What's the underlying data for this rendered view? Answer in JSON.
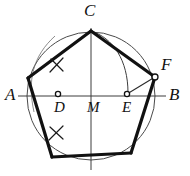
{
  "figure": {
    "kind": "geometric-construction",
    "width": 190,
    "height": 176,
    "background_color": "#ffffff",
    "ink_color": "#111111",
    "thin_stroke_color": "#555555",
    "thick_stroke_width": 3.2,
    "thin_stroke_width": 0.9,
    "circle": {
      "center_x": 91,
      "center_y": 96,
      "radius": 64
    },
    "points": {
      "A": {
        "x": 27,
        "y": 96,
        "marker": "none"
      },
      "B": {
        "x": 155,
        "y": 96,
        "marker": "none"
      },
      "C": {
        "x": 91,
        "y": 31,
        "marker": "none"
      },
      "D": {
        "x": 58,
        "y": 94,
        "marker": "open-circle"
      },
      "E": {
        "x": 127,
        "y": 94,
        "marker": "open-circle"
      },
      "F": {
        "x": 155,
        "y": 77,
        "marker": "open-circle"
      },
      "M": {
        "x": 91,
        "y": 96,
        "marker": "none"
      },
      "P_left": {
        "x": 28,
        "y": 78,
        "marker": "none"
      },
      "P_bottom_left": {
        "x": 52,
        "y": 157,
        "marker": "none"
      },
      "P_bottom_right": {
        "x": 131,
        "y": 153,
        "marker": "none"
      }
    },
    "pentagon_vertex_order": [
      "C",
      "P_left",
      "P_bottom_left",
      "P_bottom_right",
      "F"
    ],
    "labels": [
      {
        "id": "label-A",
        "text": "A",
        "x": 5,
        "y": 86,
        "size": "big"
      },
      {
        "id": "label-B",
        "text": "B",
        "x": 169,
        "y": 86,
        "size": "big"
      },
      {
        "id": "label-C",
        "text": "C",
        "x": 84,
        "y": 2,
        "size": "big"
      },
      {
        "id": "label-D",
        "text": "D",
        "x": 54,
        "y": 100,
        "size": "mid"
      },
      {
        "id": "label-E",
        "text": "E",
        "x": 122,
        "y": 100,
        "size": "mid"
      },
      {
        "id": "label-F",
        "text": "F",
        "x": 161,
        "y": 56,
        "size": "big"
      },
      {
        "id": "label-M",
        "text": "M",
        "x": 87,
        "y": 100,
        "size": "mid"
      }
    ],
    "construction_elements": {
      "diameter_AB": "horizontal chord through M from A to B",
      "vertical_axis": "vertical line through M from C down to lower circle",
      "arc_C_to_E": "compass arc swung from E through C down to the AB line",
      "segment_EF": "straight line from E to pentagon vertex F",
      "tick_marks": "two small cross marks on the upper-left and lower-left pentagon edges"
    }
  }
}
